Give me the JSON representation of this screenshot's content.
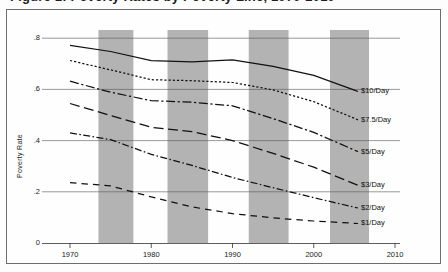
{
  "figure": {
    "clipped_title": "Figure 1: Poverty Rates by Poverty Line, 1970-2010",
    "frame": true
  },
  "chart_data": {
    "type": "line",
    "title": "",
    "xlabel": "",
    "ylabel": "Poverty Rate",
    "xlim": [
      1969,
      2011
    ],
    "ylim": [
      0,
      0.85
    ],
    "xticks": [
      1970,
      1980,
      1990,
      2000,
      2010
    ],
    "xticklabels": [
      "1970",
      "1980",
      "1990",
      "2000",
      "2010"
    ],
    "yticks": [
      0,
      0.2,
      0.4,
      0.6,
      0.8
    ],
    "yticklabels": [
      "0",
      ".2",
      ".4",
      ".6",
      ".8"
    ],
    "grid": "horizontal",
    "legend_position": "line-end-labels",
    "shaded_bands_label": "recession",
    "shaded_bands_color": "#b3b3b3",
    "shaded_bands": [
      {
        "start": 1973.5,
        "end": 1977.8
      },
      {
        "start": 1982.0,
        "end": 1987.0
      },
      {
        "start": 1992.0,
        "end": 1996.9
      },
      {
        "start": 2002.0,
        "end": 2006.8
      }
    ],
    "x": [
      1970,
      1975,
      1980,
      1985,
      1990,
      1995,
      2000,
      2005
    ],
    "series": [
      {
        "name": "$10/Day",
        "label": "$10/Day",
        "dash": "solid",
        "values": [
          0.772,
          0.748,
          0.712,
          0.708,
          0.715,
          0.69,
          0.655,
          0.597
        ]
      },
      {
        "name": "$7.5/Day",
        "label": "$7.5/Day",
        "dash": "dotted",
        "values": [
          0.713,
          0.676,
          0.638,
          0.634,
          0.627,
          0.598,
          0.552,
          0.487
        ]
      },
      {
        "name": "$5/Day",
        "label": "$5/Day",
        "dash": "dash-dot-long",
        "values": [
          0.632,
          0.589,
          0.556,
          0.55,
          0.536,
          0.486,
          0.432,
          0.363
        ]
      },
      {
        "name": "$3/Day",
        "label": "$3/Day",
        "dash": "long-dash",
        "values": [
          0.545,
          0.498,
          0.452,
          0.435,
          0.4,
          0.35,
          0.296,
          0.231
        ]
      },
      {
        "name": "$2/Day",
        "label": "$2/Day",
        "dash": "dash-dot",
        "values": [
          0.43,
          0.404,
          0.346,
          0.303,
          0.256,
          0.216,
          0.177,
          0.14
        ]
      },
      {
        "name": "$1/Day",
        "label": "$1/Day",
        "dash": "dashed",
        "values": [
          0.236,
          0.223,
          0.18,
          0.141,
          0.115,
          0.098,
          0.086,
          0.077
        ]
      }
    ]
  }
}
